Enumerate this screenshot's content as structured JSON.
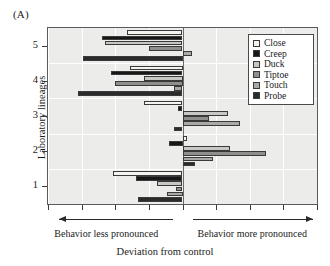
{
  "panel": {
    "label": "(A)"
  },
  "axes": {
    "y_title": "Laboratory lineages",
    "x_title": "Deviation from control",
    "y_tick_labels": [
      "1",
      "2",
      "3",
      "4",
      "5"
    ]
  },
  "captions": {
    "left": "Behavior less pronounced",
    "right": "Behavior more pronounced"
  },
  "legend": {
    "items": [
      {
        "label": "Close",
        "color": "#f4f3f0"
      },
      {
        "label": "Creep",
        "color": "#171717"
      },
      {
        "label": "Duck",
        "color": "#c8c7c3"
      },
      {
        "label": "Tiptoe",
        "color": "#8f8f8c"
      },
      {
        "label": "Touch",
        "color": "#a9a9a5"
      },
      {
        "label": "Probe",
        "color": "#2b2b2b"
      }
    ]
  },
  "chart_data": {
    "type": "bar",
    "orientation": "horizontal",
    "title": "(A)",
    "xlabel": "Deviation from control",
    "ylabel": "Laboratory lineages",
    "categories": [
      "1",
      "2",
      "3",
      "4",
      "5"
    ],
    "xlim": [
      -1.0,
      1.0
    ],
    "ylim": [
      0.5,
      5.5
    ],
    "grid": true,
    "legend_position": "top-right",
    "zero_reference": 0,
    "series": [
      {
        "name": "Close",
        "color": "#f4f3f0",
        "values": [
          -0.515,
          0.035,
          -0.285,
          -0.39,
          -0.415
        ]
      },
      {
        "name": "Creep",
        "color": "#171717",
        "values": [
          -0.345,
          -0.1,
          -0.035,
          -0.53,
          -0.6
        ]
      },
      {
        "name": "Duck",
        "color": "#c8c7c3",
        "values": [
          -0.19,
          0.35,
          0.34,
          -0.29,
          -0.575
        ]
      },
      {
        "name": "Tiptoe",
        "color": "#8f8f8c",
        "values": [
          -0.045,
          0.62,
          0.195,
          -0.5,
          -0.25
        ]
      },
      {
        "name": "Touch",
        "color": "#a9a9a5",
        "values": [
          -0.115,
          0.23,
          0.43,
          -0.065,
          0.07
        ]
      },
      {
        "name": "Probe",
        "color": "#2b2b2b",
        "values": [
          -0.33,
          0.095,
          -0.065,
          -0.775,
          -0.74
        ]
      }
    ]
  }
}
